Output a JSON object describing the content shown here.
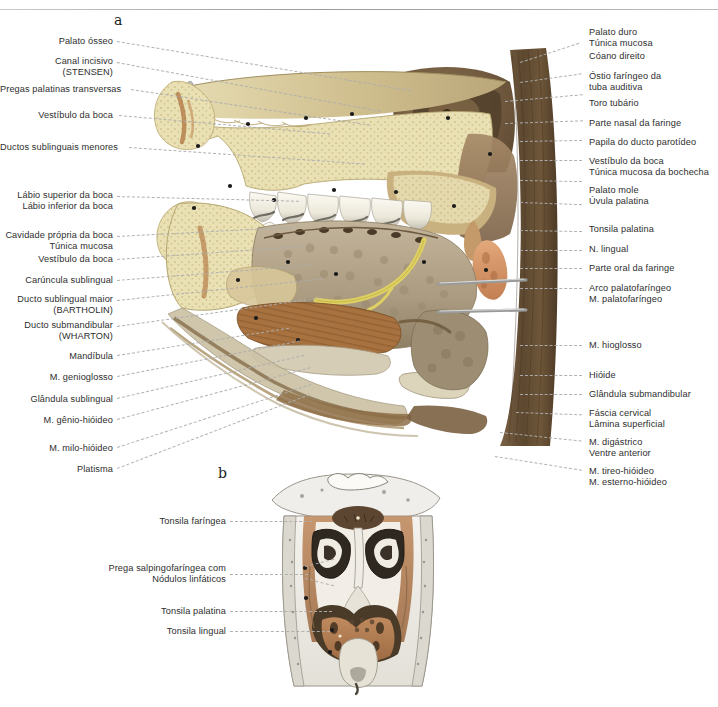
{
  "figure": {
    "panel_a_letter": "a",
    "panel_b_letter": "b"
  },
  "labels_a_left": [
    {
      "text": "Palato ósseo",
      "lines": [
        "Palato ósseo"
      ]
    },
    {
      "text": "Canal incisivo (STENSEN)",
      "lines": [
        "Canal incisivo",
        "(STENSEN)"
      ]
    },
    {
      "text": "Pregas palatinas transversas",
      "lines": [
        "Pregas palatinas transversas"
      ]
    },
    {
      "text": "Vestíbulo da boca",
      "lines": [
        "Vestíbulo da boca"
      ]
    },
    {
      "text": "Ductos sublinguais menores",
      "lines": [
        "Ductos sublinguais menores"
      ]
    },
    {
      "text": "Lábio superior da boca / Lábio inferior da boca",
      "lines": [
        "Lábio superior da boca",
        "Lábio inferior da boca"
      ]
    },
    {
      "text": "Cavidade própria da boca / Túnica mucosa",
      "lines": [
        "Cavidade própria da boca",
        "Túnica mucosa"
      ]
    },
    {
      "text": "Vestíbulo da boca",
      "lines": [
        "Vestíbulo da boca"
      ]
    },
    {
      "text": "Carúncula sublingual",
      "lines": [
        "Carúncula sublingual"
      ]
    },
    {
      "text": "Ducto sublingual maior (BARTHOLIN)",
      "lines": [
        "Ducto sublingual maior",
        "(BARTHOLIN)"
      ]
    },
    {
      "text": "Ducto submandibular (WHARTON)",
      "lines": [
        "Ducto submandibular",
        "(WHARTON)"
      ]
    },
    {
      "text": "Mandíbula",
      "lines": [
        "Mandíbula"
      ]
    },
    {
      "text": "M. genioglosso",
      "lines": [
        "M. genioglosso"
      ]
    },
    {
      "text": "Glândula sublingual",
      "lines": [
        "Glândula sublingual"
      ]
    },
    {
      "text": "M. gênio-hióideo",
      "lines": [
        "M. gênio-hióideo"
      ]
    },
    {
      "text": "M. milo-hióideo",
      "lines": [
        "M. milo-hióideo"
      ]
    },
    {
      "text": "Platisma",
      "lines": [
        "Platisma"
      ]
    }
  ],
  "labels_a_right": [
    {
      "text": "Palato duro / Túnica mucosa",
      "lines": [
        "Palato duro",
        "Túnica mucosa"
      ]
    },
    {
      "text": "Cóano direito",
      "lines": [
        "Cóano direito"
      ]
    },
    {
      "text": "Óstio faríngeo da tuba auditiva",
      "lines": [
        "Óstio faríngeo da",
        "tuba auditiva"
      ]
    },
    {
      "text": "Toro tubário",
      "lines": [
        "Toro tubário"
      ]
    },
    {
      "text": "Parte nasal da faringe",
      "lines": [
        "Parte nasal da faringe"
      ]
    },
    {
      "text": "Papila do ducto parotídeo",
      "lines": [
        "Papila do ducto parotídeo"
      ]
    },
    {
      "text": "Vestíbulo da boca / Túnica mucosa da bochecha",
      "lines": [
        "Vestíbulo da boca",
        "Túnica mucosa da bochecha"
      ]
    },
    {
      "text": "Palato mole / Úvula palatina",
      "lines": [
        "Palato mole",
        "Úvula palatina"
      ]
    },
    {
      "text": "Tonsila palatina",
      "lines": [
        "Tonsila palatina"
      ]
    },
    {
      "text": "N. lingual",
      "lines": [
        "N. lingual"
      ]
    },
    {
      "text": "Parte oral da faringe",
      "lines": [
        "Parte oral da faringe"
      ]
    },
    {
      "text": "Arco palatofaríngeo / M. palatofaríngeo",
      "lines": [
        "Arco palatofaríngeo",
        "M. palatofaríngeo"
      ]
    },
    {
      "text": "M. hioglosso",
      "lines": [
        "M. hioglosso"
      ]
    },
    {
      "text": "Hióide",
      "lines": [
        "Hióide"
      ]
    },
    {
      "text": "Glândula submandibular",
      "lines": [
        "Glândula submandibular"
      ]
    },
    {
      "text": "Fáscia cervical / Lâmina superficial",
      "lines": [
        "Fáscia cervical",
        "Lâmina superficial"
      ]
    },
    {
      "text": "M. digástrico / Ventre anterior",
      "lines": [
        "M. digástrico",
        "Ventre anterior"
      ]
    },
    {
      "text": "M. tireo-hióideo / M. esterno-hióideo",
      "lines": [
        "M. tireo-hióideo",
        "M. esterno-hióideo"
      ]
    }
  ],
  "labels_b_left": [
    {
      "text": "Tonsila faríngea",
      "lines": [
        "Tonsila faríngea"
      ]
    },
    {
      "text": "Prega salpingofaríngea com Nódulos linfáticos",
      "lines": [
        "Prega salpingofaríngea com",
        "Nódulos linfáticos"
      ]
    },
    {
      "text": "Tonsila palatina",
      "lines": [
        "Tonsila palatina"
      ]
    },
    {
      "text": "Tonsila lingual",
      "lines": [
        "Tonsila lingual"
      ]
    }
  ],
  "colors": {
    "text": "#2e2e2e",
    "leader": "#aeaeae",
    "bone": "#e8dfae",
    "bone_shade": "#cfc081",
    "mucosa_brown": "#8d7356",
    "pharynx_dark": "#6b553c",
    "tongue": "#b0a089",
    "tongue_muscle": "#9a6a3c",
    "tonsil": "#d79a6e",
    "tooth": "#f2efe6",
    "tooth_shade": "#b9b8b2",
    "cartilage": "#d8d2c0",
    "nerve_yellow": "#e4d96a",
    "rule": "#9a9a9a"
  }
}
